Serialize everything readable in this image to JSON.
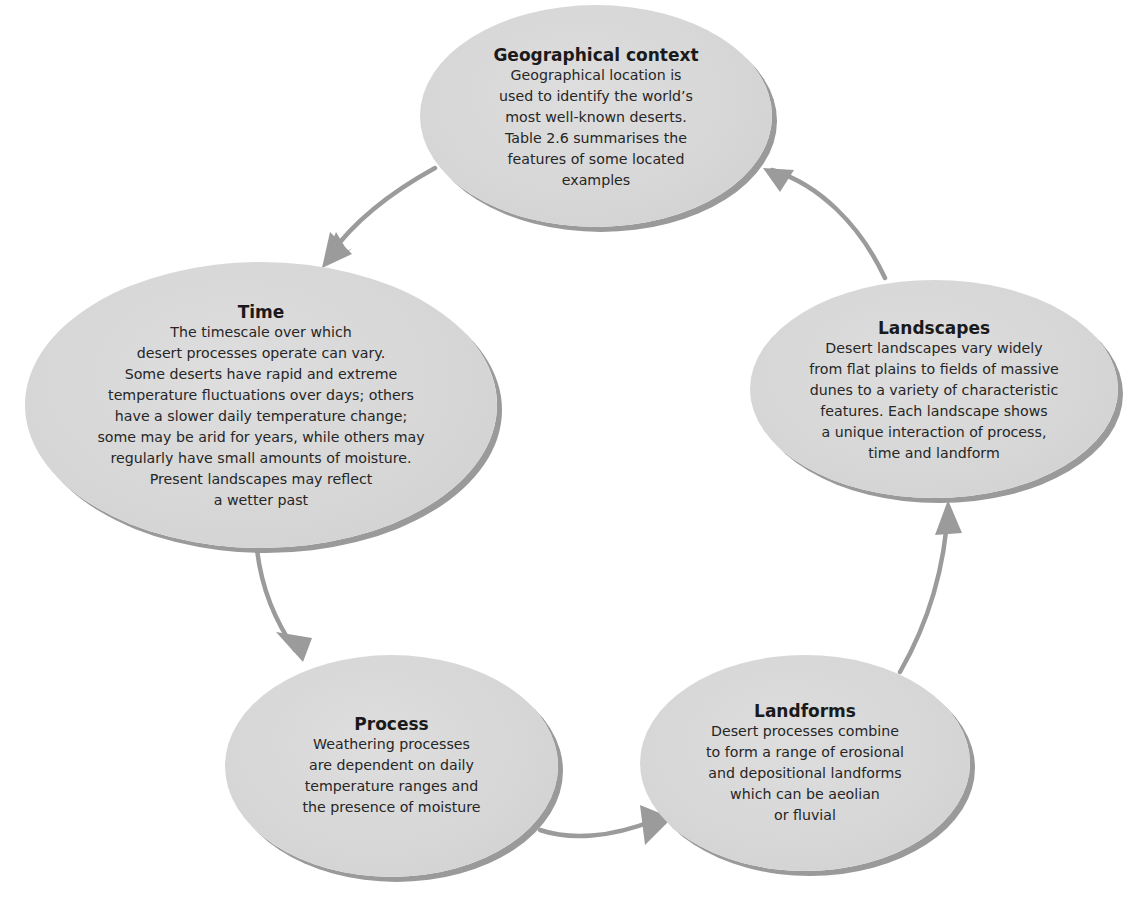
{
  "diagram": {
    "type": "cycle",
    "colors": {
      "node_fill": "#d6d6d6",
      "node_shadow": "#9a9a9a",
      "arrow": "#9b9b9b",
      "text": "#1e1e1e",
      "background": "#ffffff"
    },
    "nodes": {
      "geographical_context": {
        "title": "Geographical context",
        "lines": [
          "Geographical location is",
          "used to identify the world’s",
          "most well-known deserts.",
          "Table 2.6 summarises the",
          "features of some located",
          "examples"
        ]
      },
      "time": {
        "title": "Time",
        "lines": [
          "The timescale over which",
          "desert processes operate can vary.",
          "Some deserts have rapid and extreme",
          "temperature fluctuations over days; others",
          "have a slower daily temperature change;",
          "some may be arid for years, while others may",
          "regularly have small amounts of moisture.",
          "Present landscapes may reflect",
          "a wetter past"
        ]
      },
      "landscapes": {
        "title": "Landscapes",
        "lines": [
          "Desert landscapes vary widely",
          "from flat plains to fields of massive",
          "dunes to a variety of characteristic",
          "features. Each landscape shows",
          "a unique interaction of process,",
          "time and landform"
        ]
      },
      "process": {
        "title": "Process",
        "lines": [
          "Weathering processes",
          "are dependent on daily",
          "temperature ranges and",
          "the presence of moisture"
        ]
      },
      "landforms": {
        "title": "Landforms",
        "lines": [
          "Desert processes combine",
          "to form a range of erosional",
          "and depositional landforms",
          "which can be aeolian",
          "or fluvial"
        ]
      }
    },
    "edges": [
      {
        "from": "Geographical context",
        "to": "Time"
      },
      {
        "from": "Time",
        "to": "Process"
      },
      {
        "from": "Process",
        "to": "Landforms"
      },
      {
        "from": "Landforms",
        "to": "Landscapes"
      },
      {
        "from": "Landscapes",
        "to": "Geographical context"
      }
    ]
  }
}
